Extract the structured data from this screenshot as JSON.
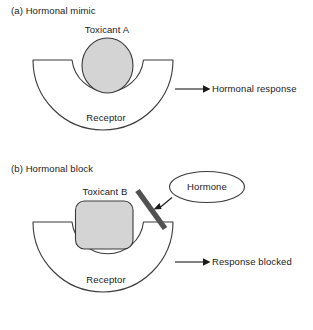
{
  "figure": {
    "width": 313,
    "height": 330,
    "background": "#ffffff",
    "stroke_color": "#3a3a3a",
    "fill_gray": "#d4d4d4",
    "rod_color": "#5a5a5a",
    "text_color": "#1a1a1a"
  },
  "panels": [
    {
      "id": "panel-a",
      "title": "(a) Hormonal mimic",
      "ligand_label": "Toxicant A",
      "ligand_shape": "circle",
      "receptor_label": "Receptor",
      "outcome_label": "Hormonal response",
      "arrow": "right-arrow"
    },
    {
      "id": "panel-b",
      "title": "(b) Hormonal block",
      "ligand_label": "Toxicant B",
      "ligand_shape": "rounded-square",
      "receptor_label": "Receptor",
      "outcome_label": "Response blocked",
      "arrow": "right-arrow",
      "blocker_label": "Hormone",
      "blocker_shape": "ellipse",
      "rod": "blocking-rod"
    }
  ]
}
